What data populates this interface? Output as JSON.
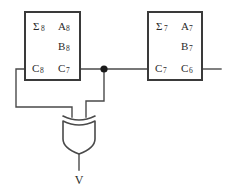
{
  "diagram": {
    "type": "logic-circuit-schematic",
    "background_color": "#ffffff",
    "line_color": "#4a4a4a",
    "box_border_color": "#3a3a3a",
    "text_color": "#2b2b2b"
  },
  "blocks": [
    {
      "id": "block-8",
      "name": "full-adder-stage-8",
      "pins": [
        {
          "name": "sum-out-8",
          "base": "Σ",
          "sub": "8",
          "position": "top-left"
        },
        {
          "name": "operand-a-8",
          "base": "A",
          "sub": "8",
          "position": "top-right"
        },
        {
          "name": "operand-b-8",
          "base": "B",
          "sub": "8",
          "position": "middle-right"
        },
        {
          "name": "carry-out-8",
          "base": "C",
          "sub": "8",
          "position": "bottom-left"
        },
        {
          "name": "carry-in-7",
          "base": "C",
          "sub": "7",
          "position": "bottom-right"
        }
      ]
    },
    {
      "id": "block-7",
      "name": "full-adder-stage-7",
      "pins": [
        {
          "name": "sum-out-7",
          "base": "Σ",
          "sub": "7",
          "position": "top-left"
        },
        {
          "name": "operand-a-7",
          "base": "A",
          "sub": "7",
          "position": "top-right"
        },
        {
          "name": "operand-b-7",
          "base": "B",
          "sub": "7",
          "position": "middle-right"
        },
        {
          "name": "carry-out-7",
          "base": "C",
          "sub": "7",
          "position": "bottom-left"
        },
        {
          "name": "carry-in-6",
          "base": "C",
          "sub": "6",
          "position": "bottom-right"
        }
      ]
    }
  ],
  "gate": {
    "name": "xor-gate",
    "symbol_type": "xor",
    "orientation": "downward",
    "inputs": 2,
    "output_label": "V"
  },
  "nets": [
    {
      "name": "carry-7-net",
      "has_junction_dot": true
    },
    {
      "name": "carry-8-net",
      "has_junction_dot": false
    },
    {
      "name": "carry-6-net",
      "has_junction_dot": false
    }
  ]
}
